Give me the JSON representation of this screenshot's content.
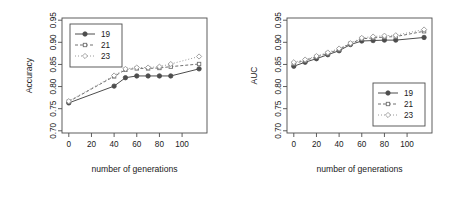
{
  "figure": {
    "background": "#ffffff",
    "axis_color": "#4d4d4d",
    "panels": [
      "accuracy",
      "auc"
    ]
  },
  "chart_data": [
    {
      "type": "line",
      "id": "accuracy",
      "title": "",
      "xlabel": "number of generations",
      "ylabel": "Accuracy",
      "xlim": [
        -6,
        122
      ],
      "ylim": [
        0.695,
        0.955
      ],
      "xticks": [
        0,
        20,
        40,
        60,
        80,
        100
      ],
      "xticklabels": [
        "0",
        "20",
        "40",
        "60",
        "80",
        "100"
      ],
      "yticks": [
        0.7,
        0.75,
        0.8,
        0.85,
        0.9,
        0.95
      ],
      "yticklabels": [
        "0.70",
        "0.75",
        "0.80",
        "0.85",
        "0.90",
        "0.95"
      ],
      "grid": false,
      "legend_position": "top-left",
      "series": [
        {
          "name": "19",
          "marker": "filled-circle",
          "linestyle": "solid",
          "color": "#4d4d4d",
          "x": [
            0,
            40,
            50,
            60,
            70,
            80,
            90,
            115
          ],
          "values": [
            0.763,
            0.801,
            0.82,
            0.824,
            0.824,
            0.824,
            0.824,
            0.84
          ]
        },
        {
          "name": "21",
          "marker": "open-square",
          "linestyle": "dashed",
          "color": "#707070",
          "x": [
            0,
            40,
            50,
            60,
            70,
            80,
            90,
            115
          ],
          "values": [
            0.766,
            0.823,
            0.838,
            0.841,
            0.841,
            0.842,
            0.845,
            0.851
          ]
        },
        {
          "name": "23",
          "marker": "open-diamond",
          "linestyle": "dotted",
          "color": "#9a9a9a",
          "x": [
            0,
            40,
            50,
            60,
            70,
            80,
            90,
            115
          ],
          "values": [
            0.767,
            0.825,
            0.84,
            0.843,
            0.843,
            0.845,
            0.851,
            0.868
          ]
        }
      ]
    },
    {
      "type": "line",
      "id": "auc",
      "title": "",
      "xlabel": "number of generations",
      "ylabel": "AUC",
      "xlim": [
        -6,
        122
      ],
      "ylim": [
        0.695,
        0.955
      ],
      "xticks": [
        0,
        20,
        40,
        60,
        80,
        100
      ],
      "xticklabels": [
        "0",
        "20",
        "40",
        "60",
        "80",
        "100"
      ],
      "yticks": [
        0.7,
        0.75,
        0.8,
        0.85,
        0.9,
        0.95
      ],
      "yticklabels": [
        "0.70",
        "0.75",
        "0.80",
        "0.85",
        "0.90",
        "0.95"
      ],
      "grid": false,
      "legend_position": "bottom-right",
      "series": [
        {
          "name": "19",
          "marker": "filled-circle",
          "linestyle": "solid",
          "color": "#4d4d4d",
          "x": [
            0,
            10,
            20,
            30,
            40,
            50,
            60,
            70,
            80,
            90,
            115
          ],
          "values": [
            0.846,
            0.855,
            0.863,
            0.872,
            0.881,
            0.895,
            0.903,
            0.904,
            0.905,
            0.905,
            0.911
          ]
        },
        {
          "name": "21",
          "marker": "open-square",
          "linestyle": "dashed",
          "color": "#707070",
          "x": [
            0,
            10,
            20,
            30,
            40,
            50,
            60,
            70,
            80,
            90,
            115
          ],
          "values": [
            0.852,
            0.859,
            0.867,
            0.875,
            0.884,
            0.897,
            0.908,
            0.91,
            0.912,
            0.913,
            0.925
          ]
        },
        {
          "name": "23",
          "marker": "open-diamond",
          "linestyle": "dotted",
          "color": "#9a9a9a",
          "x": [
            0,
            10,
            20,
            30,
            40,
            50,
            60,
            70,
            80,
            90,
            115
          ],
          "values": [
            0.855,
            0.861,
            0.869,
            0.877,
            0.886,
            0.898,
            0.91,
            0.913,
            0.915,
            0.916,
            0.929
          ]
        }
      ]
    }
  ]
}
